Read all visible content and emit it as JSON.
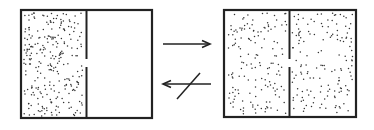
{
  "diagram": {
    "left_state": {
      "label": "gas in left half only",
      "dots_left": true,
      "dots_right": false
    },
    "right_state": {
      "label": "gas fills both halves",
      "dots_left": true,
      "dots_right": true
    },
    "forward_arrow": {
      "direction": "right",
      "crossed": false
    },
    "reverse_arrow": {
      "direction": "left",
      "crossed": true
    },
    "colors": {
      "stroke": "#222222",
      "dot": "#333333",
      "background": "#ffffff"
    }
  }
}
